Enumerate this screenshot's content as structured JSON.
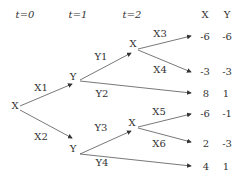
{
  "time_labels": [
    "t=0",
    "t=1",
    "t=2"
  ],
  "payoff_headers": [
    "X",
    "Y"
  ],
  "nodes": {
    "root": "X",
    "t1_top": "Y",
    "t1_bottom": "Y",
    "t2_top": "X",
    "t2_bottom": "X"
  },
  "edges": {
    "X1": "X1",
    "X2": "X2",
    "Y1": "Y1",
    "Y2": "Y2",
    "Y3": "Y3",
    "Y4": "Y4",
    "X3": "X3",
    "X4": "X4",
    "X5": "X5",
    "X6": "X6"
  },
  "payoffs": [
    {
      "x": "-6",
      "y": "-6"
    },
    {
      "x": "-3",
      "y": "-3"
    },
    {
      "x": "8",
      "y": "1"
    },
    {
      "x": "-6",
      "y": "-1"
    },
    {
      "x": "2",
      "y": "-3"
    },
    {
      "x": "4",
      "y": "1"
    }
  ]
}
